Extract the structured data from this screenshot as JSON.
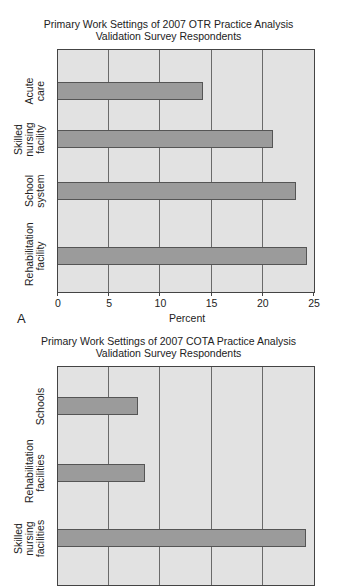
{
  "chart_data": [
    {
      "type": "bar",
      "orientation": "horizontal",
      "panel_label": "A",
      "title": "Primary Work Settings of 2007 OTR Practice Analysis Validation Survey Respondents",
      "title_lines": [
        "Primary Work Settings of 2007 OTR Practice Analysis",
        "Validation Survey Respondents"
      ],
      "categories": [
        "Acute care",
        "Skilled nursing facility",
        "School system",
        "Rehabilitation facility"
      ],
      "category_label_lines": [
        [
          "Acute",
          "care"
        ],
        [
          "Skilled",
          "nursing",
          "facility"
        ],
        [
          "School",
          "system"
        ],
        [
          "Rehabilitation",
          "facility"
        ]
      ],
      "values": [
        14.2,
        21.0,
        23.2,
        24.3
      ],
      "xlabel": "Percent",
      "ylabel": "",
      "xlim": [
        0,
        25
      ],
      "xticks": [
        "0",
        "5",
        "10",
        "15",
        "20",
        "25"
      ],
      "grid": true,
      "legend": null
    },
    {
      "type": "bar",
      "orientation": "horizontal",
      "title": "Primary Work Settings of 2007 COTA Practice Analysis Validation Survey Respondents",
      "title_lines": [
        "Primary Work Settings of 2007 COTA Practice Analysis",
        "Validation Survey Respondents"
      ],
      "categories": [
        "Schools",
        "Rehabilitation facilities",
        "Skilled nursing facilities"
      ],
      "category_label_lines": [
        [
          "Schools"
        ],
        [
          "Rehabilitation",
          "facilities"
        ],
        [
          "Skilled",
          "nursing",
          "facilities"
        ]
      ],
      "values": [
        7.8,
        8.5,
        24.2
      ],
      "xlim": [
        0,
        25
      ],
      "grid": true,
      "legend": null,
      "note": "chart truncated at bottom of image"
    }
  ],
  "colors": {
    "plot_bg": "#e2e2e2",
    "bar_fill": "#9b9b9b",
    "bar_border": "#555555",
    "grid": "#6a6a6a"
  }
}
